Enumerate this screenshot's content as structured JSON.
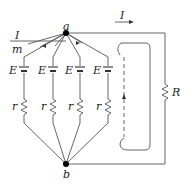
{
  "diagram": {
    "type": "circuit",
    "nodes": {
      "a": "a",
      "b": "b"
    },
    "current_label_left": "I",
    "branch_label_left": "m",
    "current_label_top": "I",
    "external_resistor": "R",
    "branches": [
      {
        "emf": "E",
        "resistance": "r"
      },
      {
        "emf": "E",
        "resistance": "r"
      },
      {
        "emf": "E",
        "resistance": "r"
      },
      {
        "emf": "E",
        "resistance": "r"
      }
    ],
    "colors": {
      "wire": "#555555",
      "node": "#000000",
      "label": "#222222"
    }
  }
}
